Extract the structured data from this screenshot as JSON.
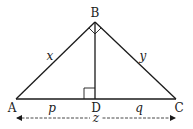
{
  "diagram": {
    "points": {
      "A": {
        "label": "A",
        "x": 16,
        "y": 99
      },
      "B": {
        "label": "B",
        "x": 95,
        "y": 22
      },
      "C": {
        "label": "C",
        "x": 176,
        "y": 99
      },
      "D": {
        "label": "D",
        "x": 95,
        "y": 99
      }
    },
    "sides": {
      "AB": {
        "label": "x"
      },
      "BC": {
        "label": "y"
      },
      "AD": {
        "label": "p"
      },
      "DC": {
        "label": "q"
      },
      "AC": {
        "label": "z"
      }
    },
    "right_angles": [
      "ABC",
      "BDA"
    ],
    "colors": {
      "stroke": "#1a1a1a",
      "background": "#ffffff"
    }
  }
}
